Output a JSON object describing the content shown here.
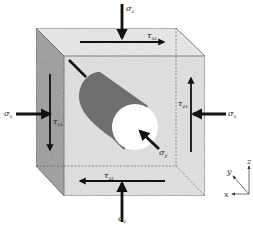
{
  "figure": {
    "colors": {
      "front_face": "#e4e4e4",
      "top_face": "#ececec",
      "left_face": "#9a9a9a",
      "cylinder_body": "#6e6e6e",
      "cylinder_end": "#ffffff",
      "arrows": "#111111",
      "edges": "#555555"
    }
  },
  "labels": {
    "sigma_z_top": {
      "symbol": "σ",
      "sub": "z"
    },
    "sigma_z_bottom": {
      "symbol": "σ",
      "sub": "z"
    },
    "sigma_x_left": {
      "symbol": "σ",
      "sub": "x"
    },
    "sigma_x_right": {
      "symbol": "σ",
      "sub": "x"
    },
    "sigma_y": {
      "symbol": "σ",
      "sub": "y"
    },
    "tau_xz_top": {
      "symbol": "τ",
      "sub": "xz"
    },
    "tau_xz_bottom": {
      "symbol": "τ",
      "sub": "xz"
    },
    "tau_zx_left": {
      "symbol": "τ",
      "sub": "zx"
    },
    "tau_zx_right": {
      "symbol": "τ",
      "sub": "zx"
    }
  },
  "axes": {
    "x": "x",
    "y": "y",
    "z": "z"
  }
}
